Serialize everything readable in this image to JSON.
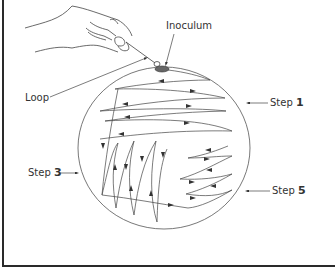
{
  "diagram": {
    "type": "streak-plate-method",
    "labels": {
      "inoculum": "Inoculum",
      "loop": "Loop",
      "step1_word": "Step",
      "step1_num": "1",
      "step3_word": "Step",
      "step3_num": "3",
      "step5_word": "Step",
      "step5_num": "5"
    },
    "colors": {
      "line": "#3a3a3a",
      "frame": "#2a2a2a",
      "background": "#ffffff"
    },
    "elements": [
      "hand-holding-loop",
      "petri-dish",
      "inoculum-smear",
      "streak-lines-step-1",
      "streak-lines-step-3",
      "streak-lines-step-5"
    ]
  }
}
